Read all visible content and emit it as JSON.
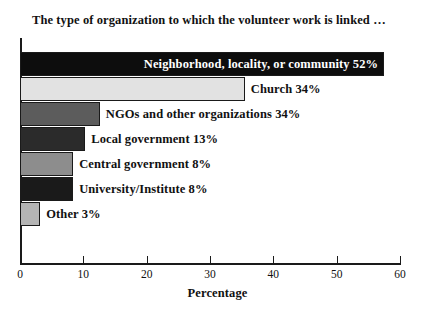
{
  "chart_data": {
    "type": "bar",
    "orientation": "horizontal",
    "title": "The type of organization to which the volunteer work is linked …",
    "xlabel": "Percentage",
    "ylabel": "",
    "xlim": [
      0,
      60
    ],
    "xticks": [
      0,
      10,
      20,
      30,
      40,
      50,
      60
    ],
    "xtick_labels": [
      "0",
      "10",
      "20",
      "30",
      "40",
      "50",
      "60"
    ],
    "grid": false,
    "legend": "none",
    "categories": [
      "Neighborhood, locality, or community",
      "Church",
      "NGOs and other organizations",
      "Local government",
      "Central government",
      "University/Institute",
      "Other"
    ],
    "values": [
      52,
      34,
      34,
      13,
      8,
      8,
      3
    ],
    "bars": [
      {
        "category": "Neighborhood, locality, or community",
        "value": 52,
        "data_label": "Neighborhood, locality, or community 52%",
        "label_position": "inside",
        "drawn_length": 57.5,
        "fill": "#0d0d0d"
      },
      {
        "category": "Church",
        "value": 34,
        "data_label": "Church 34%",
        "label_position": "outside",
        "drawn_length": 35.5,
        "fill": "#e2e2e2"
      },
      {
        "category": "NGOs and other organizations",
        "value": 34,
        "data_label": "NGOs and other organizations 34%",
        "label_position": "outside",
        "drawn_length": 12.6,
        "fill": "#5c5c5c"
      },
      {
        "category": "Local government",
        "value": 13,
        "data_label": "Local government 13%",
        "label_position": "outside",
        "drawn_length": 10.3,
        "fill": "#2b2b2b"
      },
      {
        "category": "Central government",
        "value": 8,
        "data_label": "Central government 8%",
        "label_position": "outside",
        "drawn_length": 8.4,
        "fill": "#8d8d8d"
      },
      {
        "category": "University/Institute",
        "value": 8,
        "data_label": "University/Institute 8%",
        "label_position": "outside",
        "drawn_length": 8.4,
        "fill": "#1a1a1a"
      },
      {
        "category": "Other",
        "value": 3,
        "data_label": "Other 3%",
        "label_position": "outside",
        "drawn_length": 3.2,
        "fill": "#b4b4b4"
      }
    ]
  }
}
